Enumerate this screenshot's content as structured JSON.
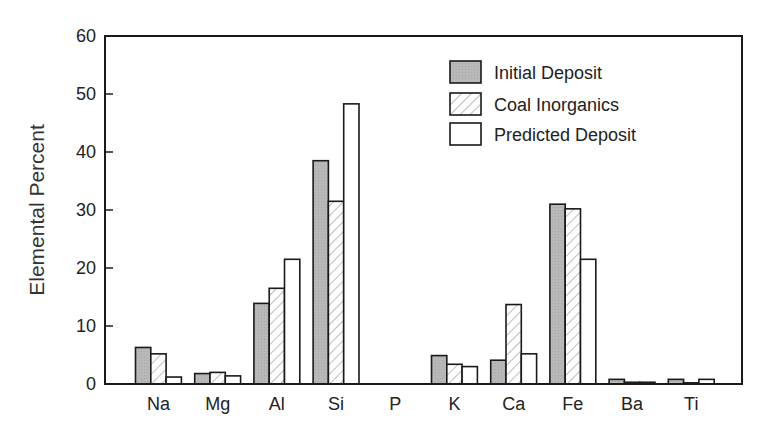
{
  "chart_data": {
    "type": "bar",
    "title": "",
    "xlabel": "",
    "ylabel": "Elemental Percent",
    "ylim": [
      0,
      60
    ],
    "yticks": [
      0,
      10,
      20,
      30,
      40,
      50,
      60
    ],
    "grid": false,
    "legend_position": "upper right (inside)",
    "categories": [
      "Na",
      "Mg",
      "Al",
      "Si",
      "P",
      "K",
      "Ca",
      "Fe",
      "Ba",
      "Ti"
    ],
    "series": [
      {
        "name": "Initial Deposit",
        "style": "gray-fill",
        "values": [
          6.3,
          1.8,
          13.9,
          38.5,
          0,
          4.9,
          4.1,
          31.0,
          0.8,
          0.8
        ]
      },
      {
        "name": "Coal Inorganics",
        "style": "hatched",
        "values": [
          5.2,
          2.0,
          16.5,
          31.5,
          0,
          3.4,
          13.7,
          30.2,
          0.3,
          0.2
        ]
      },
      {
        "name": "Predicted Deposit",
        "style": "white-fill",
        "values": [
          1.2,
          1.4,
          21.5,
          48.3,
          0,
          3.0,
          5.2,
          21.5,
          0.3,
          0.8
        ]
      }
    ],
    "colors": {
      "initial": "#b5b5b5",
      "coal_hatch": "#9a9a9a",
      "predicted": "#ffffff",
      "outline": "#1a1a1a"
    }
  }
}
